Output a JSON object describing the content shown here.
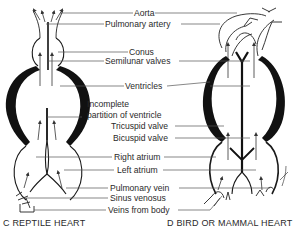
{
  "labels": {
    "aorta": "Aorta",
    "pulmonary_artery": "Pulmonary artery",
    "conus": "Conus",
    "semilunar_valves": "Semilunar valves",
    "ventricles": "Ventricles",
    "incomplete_partition_line1": "Incomplete",
    "incomplete_partition_line2": "partition of ventricle",
    "tricuspid_valve": "Tricuspid valve",
    "bicuspid_valve": "Bicuspid valve",
    "right_atrium": "Right atrium",
    "left_atrium": "Left atrium",
    "pulmonary_vein": "Pulmonary vein",
    "sinus_venosus": "Sinus venosus",
    "veins_from_body": "Veins from body"
  },
  "captions": {
    "left": "C  REPTILE HEART",
    "right": "D  BIRD OR MAMMAL HEART"
  },
  "colors": {
    "ink": "#111111",
    "text": "#2a2a2a",
    "background": "#ffffff"
  }
}
